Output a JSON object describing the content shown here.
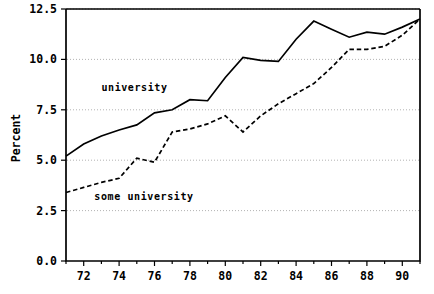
{
  "chart_data": {
    "type": "line",
    "title": "",
    "subtitle": "",
    "xlabel": "",
    "ylabel": "Percent",
    "xlim": [
      71,
      91
    ],
    "ylim": [
      0.0,
      12.5
    ],
    "grid": true,
    "grid_axis": "y",
    "legend_position": "inline-annotation",
    "x": [
      71,
      72,
      73,
      74,
      75,
      76,
      77,
      78,
      79,
      80,
      81,
      82,
      83,
      84,
      85,
      86,
      87,
      88,
      89,
      90,
      91
    ],
    "xticks_major": [
      72,
      74,
      76,
      78,
      80,
      82,
      84,
      86,
      88,
      90
    ],
    "xtick_labels": [
      "72",
      "74",
      "76",
      "78",
      "80",
      "82",
      "84",
      "86",
      "88",
      "90"
    ],
    "xticks_minor": [
      71,
      73,
      75,
      77,
      79,
      81,
      83,
      85,
      87,
      89,
      91
    ],
    "yticks": [
      0.0,
      2.5,
      5.0,
      7.5,
      10.0,
      12.5
    ],
    "ytick_labels": [
      "0.0",
      "2.5",
      "5.0",
      "7.5",
      "10.0",
      "12.5"
    ],
    "series": [
      {
        "name": "university",
        "style": "solid",
        "color": "#000000",
        "annotation": "university",
        "values": [
          5.2,
          5.8,
          6.2,
          6.5,
          6.75,
          7.35,
          7.5,
          8.0,
          7.95,
          9.1,
          10.1,
          9.95,
          9.9,
          11.0,
          11.9,
          11.5,
          11.1,
          11.35,
          11.25,
          11.6,
          12.0
        ]
      },
      {
        "name": "some university",
        "style": "dashed",
        "color": "#000000",
        "annotation": "some university",
        "values": [
          3.4,
          3.65,
          3.9,
          4.1,
          5.1,
          4.9,
          6.4,
          6.55,
          6.8,
          7.2,
          6.4,
          7.2,
          7.8,
          8.3,
          8.8,
          9.6,
          10.5,
          10.5,
          10.65,
          11.2,
          12.0
        ]
      }
    ],
    "annotations": [
      {
        "text": "university",
        "x": 73.0,
        "y": 8.45
      },
      {
        "text": "some university",
        "x": 72.6,
        "y": 3.05
      }
    ]
  },
  "axis": {
    "y_title": "Percent"
  }
}
